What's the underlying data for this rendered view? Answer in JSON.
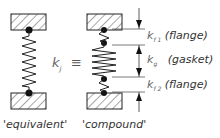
{
  "diagram": {
    "equivalent": {
      "caption": "'equivalent'",
      "stiffness": "k",
      "stiffness_sub": "j"
    },
    "equiv_symbol": "≡",
    "compound": {
      "caption": "'compound'",
      "parts": [
        {
          "k": "k",
          "sub": "f 1",
          "label": "(flange)"
        },
        {
          "k": "k",
          "sub": "g",
          "label": "(gasket)"
        },
        {
          "k": "k",
          "sub": "f 2",
          "label": "(flange)"
        }
      ]
    }
  }
}
